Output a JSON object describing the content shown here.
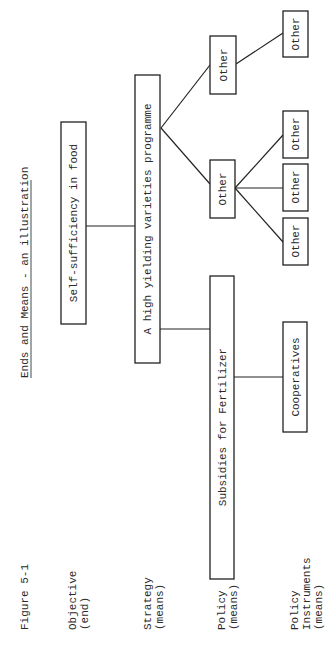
{
  "figure": {
    "number": "Figure 5-1",
    "title": "Ends and Means - an illustration",
    "orientation": "rotated 90 degrees counter-clockwise"
  },
  "levels": [
    {
      "line1": "Objective",
      "line2": "(end)"
    },
    {
      "line1": "Strategy",
      "line2": "(means)"
    },
    {
      "line1": "Policy",
      "line2": "(means)"
    },
    {
      "line1": "Policy",
      "line2": "Instruments",
      "line3": "(means)"
    }
  ],
  "nodes": {
    "objective": "Self-sufficiency in food",
    "strategy": "A high yielding varieties programme",
    "policy_subsidies": "Subsidies for Fertilizer",
    "policy_other_a": "Other",
    "policy_other_b": "Other",
    "instrument_cooperatives": "Cooperatives",
    "instrument_other_1": "Other",
    "instrument_other_2": "Other",
    "instrument_other_3": "Other",
    "instrument_other_4": "Other"
  },
  "edges": [
    [
      "objective",
      "strategy"
    ],
    [
      "strategy",
      "policy_subsidies"
    ],
    [
      "strategy",
      "policy_other_a"
    ],
    [
      "strategy",
      "policy_other_b"
    ],
    [
      "policy_subsidies",
      "instrument_cooperatives"
    ],
    [
      "policy_other_a",
      "instrument_other_1"
    ],
    [
      "policy_other_a",
      "instrument_other_2"
    ],
    [
      "policy_other_a",
      "instrument_other_3"
    ],
    [
      "policy_other_b",
      "instrument_other_4"
    ]
  ]
}
